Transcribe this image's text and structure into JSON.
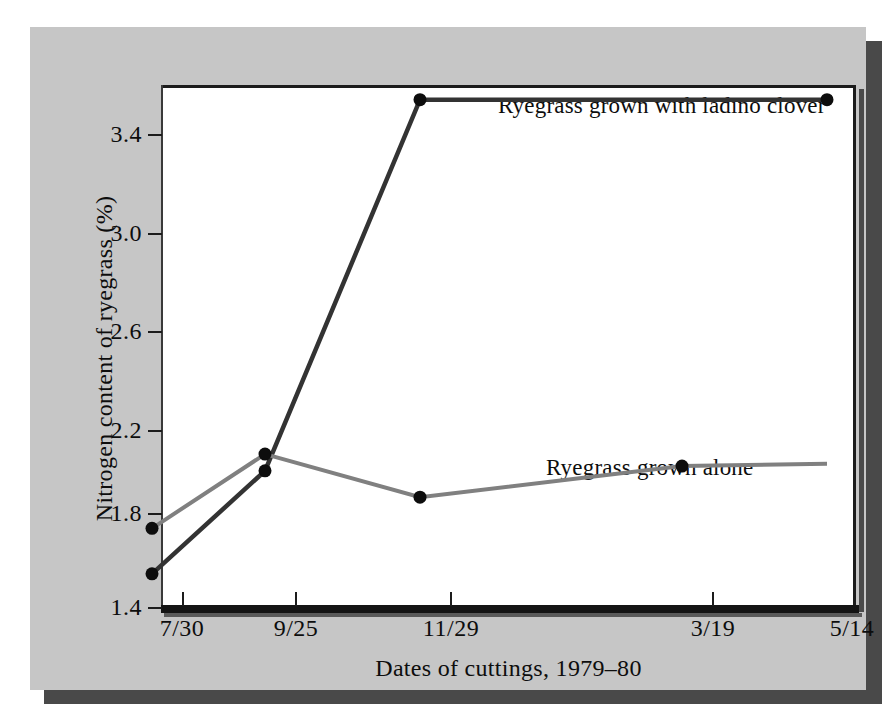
{
  "figure": {
    "background_color": "#c6c6c6",
    "plot_background_color": "#ffffff",
    "shadow_color": "#494949"
  },
  "chart_data": {
    "type": "line",
    "title": "",
    "xlabel": "Dates of cuttings, 1979–80",
    "ylabel": "Nitrogen content of ryegrass (%)",
    "categories": [
      "7/30",
      "9/25",
      "11/29",
      "3/19",
      "5/14"
    ],
    "yticks": [
      "1.4",
      "1.8",
      "2.2",
      "2.6",
      "3.0",
      "3.4"
    ],
    "ylim": [
      1.4,
      3.58
    ],
    "grid": false,
    "legend_position": "inline-annotation",
    "series": [
      {
        "name": "Ryegrass grown with ladino clover",
        "color": "#333333",
        "values": [
          1.43,
          1.86,
          3.41,
          3.41,
          3.41
        ],
        "markers": [
          true,
          true,
          true,
          false,
          true
        ]
      },
      {
        "name": "Ryegrass grown alone",
        "color": "#808080",
        "values": [
          1.62,
          1.93,
          1.75,
          1.88,
          1.89
        ],
        "markers": [
          true,
          true,
          true,
          true,
          false
        ]
      }
    ],
    "annotations": [
      {
        "text": "Ryegrass grown with ladino clover",
        "series": 0
      },
      {
        "text": "Ryegrass grown alone",
        "series": 1
      }
    ]
  }
}
